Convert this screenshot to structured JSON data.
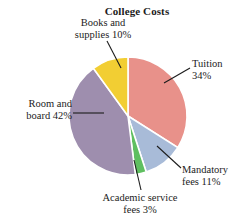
{
  "chart_data": {
    "type": "pie",
    "title": "College Costs",
    "xlabel": "",
    "ylabel": "",
    "grid": false,
    "legend_position": "none",
    "labels_position": "outside-with-leader-lines",
    "start_angle_clock": "12 o'clock",
    "direction": "clockwise",
    "categories": [
      "Tuition",
      "Mandatory fees",
      "Academic service fees",
      "Room and board",
      "Books and supplies"
    ],
    "values": [
      34,
      11,
      3,
      42,
      10
    ],
    "value_unit": "%",
    "total": 100,
    "colors": [
      "#E8918A",
      "#A8BBD8",
      "#5FBF60",
      "#9E8EAE",
      "#F2CE33"
    ],
    "slice_border_color": "#FFFFFF",
    "slices": [
      {
        "name": "Tuition",
        "value": 34,
        "color": "#E8918A",
        "label_line1": "Tuition",
        "label_line2": "34%"
      },
      {
        "name": "Mandatory fees",
        "value": 11,
        "color": "#A8BBD8",
        "label_line1": "Mandatory",
        "label_line2": "fees 11%"
      },
      {
        "name": "Academic service fees",
        "value": 3,
        "color": "#5FBF60",
        "label_line1": "Academic service",
        "label_line2": "fees 3%"
      },
      {
        "name": "Room and board",
        "value": 42,
        "color": "#9E8EAE",
        "label_line1": "Room and",
        "label_line2": "board 42%"
      },
      {
        "name": "Books and supplies",
        "value": 10,
        "color": "#F2CE33",
        "label_line1": "Books and",
        "label_line2": "supplies 10%"
      }
    ]
  }
}
